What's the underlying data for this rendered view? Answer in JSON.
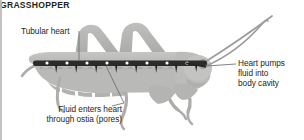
{
  "figure": {
    "title": "GRASSHOPPER",
    "background_color": "#ffffff",
    "text_color": "#231f20"
  },
  "labels": {
    "tubular_heart": "Tubular heart",
    "heart_pumps": "Heart pumps\nfluid into\nbody cavity",
    "fluid_enters": "Fluid enters heart\nthrough ostia (pores)",
    "species": "GRASSHOPPER"
  },
  "callouts": [
    {
      "name": "tubular-heart",
      "text": "Tubular heart",
      "leader": "vertical-down"
    },
    {
      "name": "heart-pumps",
      "text": "Heart pumps fluid into body cavity",
      "leader": "horizontal-left"
    },
    {
      "name": "fluid-enters-ostia",
      "text": "Fluid enters heart through ostia (pores)",
      "leader": "diagonal-up-right"
    }
  ],
  "colors": {
    "body_light": "#c9c9c7",
    "body_mid": "#b3b3b1",
    "body_dark": "#9a9a98",
    "heart_dark": "#2b2b2b",
    "ostia_dot": "#ffffff",
    "leader_line": "#6d6d6d",
    "edge_rule": "#b8b8b8"
  },
  "anatomy": {
    "heart_label": "tubular heart",
    "ostia_count": 8,
    "antennae_count": 2,
    "legs_visible": 4
  }
}
